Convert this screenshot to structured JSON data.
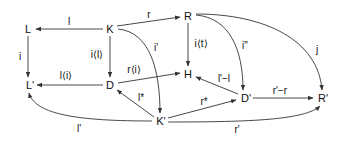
{
  "diagram": {
    "type": "commutative-diagram",
    "stroke_color": "#333333",
    "nodes": {
      "L": "L",
      "K": "K",
      "R": "R",
      "H": "H",
      "Lp": "L'",
      "D": "D",
      "Dp": "D'",
      "Rp": "R'",
      "Kp": "K'"
    },
    "edges": [
      {
        "from": "K",
        "to": "L",
        "label": "l"
      },
      {
        "from": "K",
        "to": "R",
        "label": "r"
      },
      {
        "from": "L",
        "to": "L'",
        "label": "i"
      },
      {
        "from": "K",
        "to": "D",
        "label": "i⟨l⟩"
      },
      {
        "from": "K",
        "to": "K'",
        "label": "i'"
      },
      {
        "from": "R",
        "to": "H",
        "label": "i⟨t⟩"
      },
      {
        "from": "R",
        "to": "D'",
        "label": "i\""
      },
      {
        "from": "R",
        "to": "R'",
        "label": "j"
      },
      {
        "from": "D",
        "to": "L'",
        "label": "l⟨i⟩"
      },
      {
        "from": "D",
        "to": "H",
        "label": "r⟨i⟩"
      },
      {
        "from": "D'",
        "to": "H",
        "label": "l'−l"
      },
      {
        "from": "K'",
        "to": "D",
        "label": "l*"
      },
      {
        "from": "K'",
        "to": "D'",
        "label": "r*"
      },
      {
        "from": "D'",
        "to": "R'",
        "label": "r'−r"
      },
      {
        "from": "K'",
        "to": "L'",
        "label": "l'"
      },
      {
        "from": "K'",
        "to": "R'",
        "label": "r'"
      }
    ]
  }
}
